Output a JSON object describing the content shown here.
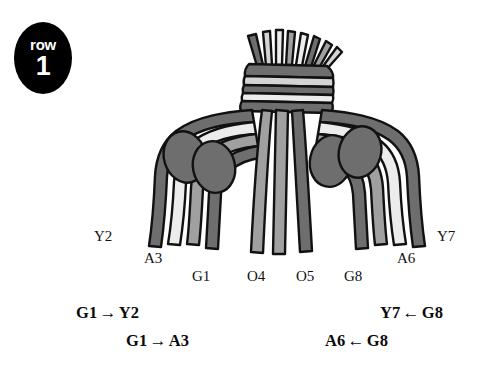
{
  "figure": {
    "background_color": "#ffffff",
    "outline_color": "#111111"
  },
  "row_badge": {
    "name": "row-badge",
    "word": "row",
    "number": "1",
    "background_color": "#000000",
    "text_color": "#ffffff"
  },
  "palette": {
    "dark_gray": "#6e6e6e",
    "mid_gray": "#a0a0a0",
    "light_gray": "#d4d4d4",
    "pale_gray": "#ececec",
    "outline": "#111111",
    "knot_fill": "#6e6e6e"
  },
  "collar": {
    "name": "primary-cord-collar",
    "bands": [
      {
        "shade": "dark_gray"
      },
      {
        "shade": "light_gray"
      },
      {
        "shade": "dark_gray"
      },
      {
        "shade": "pale_gray"
      },
      {
        "shade": "dark_gray"
      }
    ]
  },
  "cords": [
    {
      "id": "Y2",
      "label": "Y2",
      "shade": "pale_gray",
      "side": "left",
      "label_x": 94,
      "label_y": 228
    },
    {
      "id": "A3",
      "label": "A3",
      "shade": "mid_gray",
      "side": "left",
      "label_x": 144,
      "label_y": 250
    },
    {
      "id": "G1",
      "label": "G1",
      "shade": "dark_gray",
      "side": "left",
      "label_x": 192,
      "label_y": 268
    },
    {
      "id": "O4",
      "label": "O4",
      "shade": "mid_gray",
      "side": "center",
      "label_x": 247,
      "label_y": 268
    },
    {
      "id": "O5",
      "label": "O5",
      "shade": "mid_gray",
      "side": "center",
      "label_x": 296,
      "label_y": 268
    },
    {
      "id": "G8",
      "label": "G8",
      "shade": "dark_gray",
      "side": "right",
      "label_x": 344,
      "label_y": 268
    },
    {
      "id": "A6",
      "label": "A6",
      "shade": "mid_gray",
      "side": "right",
      "label_x": 397,
      "label_y": 250
    },
    {
      "id": "Y7",
      "label": "Y7",
      "shade": "pale_gray",
      "side": "right",
      "label_x": 437,
      "label_y": 228
    }
  ],
  "knots": [
    {
      "name": "knot-left-outer",
      "side": "left",
      "cx": 185,
      "cy": 157
    },
    {
      "name": "knot-left-inner",
      "side": "left",
      "cx": 213,
      "cy": 166
    },
    {
      "name": "knot-right-inner",
      "side": "right",
      "cx": 331,
      "cy": 161
    },
    {
      "name": "knot-right-outer",
      "side": "right",
      "cx": 360,
      "cy": 152
    }
  ],
  "relations": [
    {
      "name": "relation-g1-y2",
      "from": "G1",
      "arrow": "→",
      "to": "Y2",
      "side": "left",
      "x": 76,
      "y": 303
    },
    {
      "name": "relation-g1-a3",
      "from": "G1",
      "arrow": "→",
      "to": "A3",
      "side": "left",
      "x": 126,
      "y": 331
    },
    {
      "name": "relation-y7-g8",
      "from": "Y7",
      "arrow": "←",
      "to": "G8",
      "side": "right",
      "x": 380,
      "y": 303
    },
    {
      "name": "relation-a6-g8",
      "from": "A6",
      "arrow": "←",
      "to": "G8",
      "side": "right",
      "x": 325,
      "y": 331
    }
  ]
}
